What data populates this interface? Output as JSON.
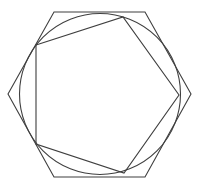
{
  "diagram": {
    "title": "",
    "shapes": [
      {
        "id": "hexagon",
        "kind": "regular-polygon",
        "sides": 6,
        "relation": "outer, circumscribes circle"
      },
      {
        "id": "circle",
        "kind": "circle",
        "relation": "inscribed in hexagon"
      },
      {
        "id": "pentagon",
        "kind": "regular-polygon",
        "sides": 5,
        "relation": "inscribed in circle"
      }
    ],
    "colors": {
      "line": "#3f3f3f",
      "background": "#ffffff"
    }
  }
}
